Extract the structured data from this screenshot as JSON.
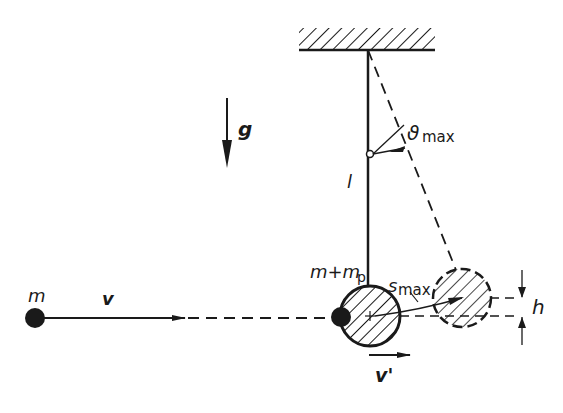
{
  "diagram": {
    "type": "ballistic-pendulum",
    "labels": {
      "gravity": "g",
      "length": "l",
      "projectile_mass": "m",
      "projectile_velocity": "v",
      "combined_mass_main": "m+m",
      "combined_mass_sub": "p",
      "velocity_after": "v'",
      "angle_symbol": "ϑ",
      "angle_sub": "max",
      "arc_symbol": "s",
      "arc_sub": "max",
      "height": "h"
    },
    "colors": {
      "ink": "#1a1a1a",
      "background": "#ffffff"
    }
  }
}
